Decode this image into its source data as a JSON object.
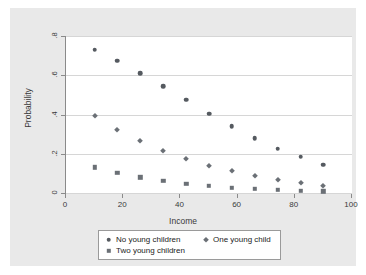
{
  "chart_data": {
    "type": "scatter",
    "title": "",
    "xlabel": "Income",
    "ylabel": "Probability",
    "xlim": [
      0,
      100
    ],
    "ylim": [
      0,
      0.8
    ],
    "xticks": [
      "0",
      "20",
      "40",
      "60",
      "80",
      "100"
    ],
    "xtick_values": [
      0,
      20,
      40,
      60,
      80,
      100
    ],
    "yticks": [
      "0",
      ".2",
      ".4",
      ".6",
      ".8"
    ],
    "ytick_values": [
      0,
      0.2,
      0.4,
      0.6,
      0.8
    ],
    "grid": "horizontal",
    "legend_position": "bottom",
    "x": [
      10,
      18,
      26,
      34,
      42,
      50,
      58,
      66,
      74,
      82,
      90
    ],
    "series": [
      {
        "name": "No young children",
        "marker": "circle",
        "color": "#555a60",
        "values": [
          0.73,
          0.675,
          0.61,
          0.545,
          0.475,
          0.405,
          0.34,
          0.28,
          0.225,
          0.185,
          0.145
        ]
      },
      {
        "name": "One young child",
        "marker": "diamond",
        "color": "#6b7076",
        "values": [
          0.39,
          0.32,
          0.265,
          0.215,
          0.175,
          0.138,
          0.11,
          0.085,
          0.065,
          0.05,
          0.038
        ]
      },
      {
        "name": "Two young children",
        "marker": "square",
        "color": "#6b7076",
        "values": [
          0.13,
          0.103,
          0.08,
          0.062,
          0.047,
          0.036,
          0.028,
          0.021,
          0.016,
          0.012,
          0.009
        ]
      }
    ]
  },
  "legend": {
    "entries": [
      {
        "label": "No young children",
        "marker": "circle"
      },
      {
        "label": "One young child",
        "marker": "diamond"
      },
      {
        "label": "Two young children",
        "marker": "square"
      }
    ]
  },
  "colors": {
    "graph_region": "#e9e9e9",
    "plot_background": "#ffffff",
    "gridline": "#d6d6d6",
    "axis": "#8a8a8a",
    "series_1": "#555a60",
    "series_2": "#6b7076",
    "series_3": "#6b7076"
  }
}
